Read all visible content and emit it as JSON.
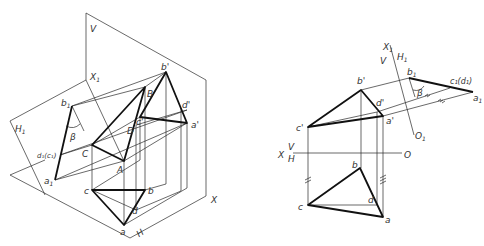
{
  "figure": {
    "left_view": {
      "title": "Isometric view of auxiliary plane projection",
      "labels": {
        "V": "V",
        "H": "H",
        "H1": "H",
        "H1_sub": "1",
        "X": "X",
        "X1": "X",
        "X1_sub": "1",
        "b_prime": "b'",
        "d_prime": "d'",
        "a_prime": "a'",
        "c_prime": "c'",
        "B": "B",
        "D": "D",
        "A": "A",
        "C": "C",
        "a": "a",
        "b": "b",
        "c": "c",
        "d": "d",
        "b1": "b",
        "b1_sub": "1",
        "a1": "a",
        "a1_sub": "1",
        "d1c1": "d₁(c₁)",
        "beta": "β"
      }
    },
    "right_view": {
      "title": "Orthographic projection with auxiliary view",
      "labels": {
        "X": "X",
        "V": "V",
        "H": "H",
        "O": "O",
        "X1": "X",
        "X1_sub": "1",
        "V_aux": "V",
        "H1": "H",
        "H1_sub": "1",
        "O1": "O",
        "O1_sub": "1",
        "b_prime": "b'",
        "d_prime": "d'",
        "a_prime": "a'",
        "c_prime": "c'",
        "a": "a",
        "b": "b",
        "c": "c",
        "d": "d",
        "b1": "b",
        "b1_sub": "1",
        "c1d1": "c₁(d₁)",
        "a1": "a",
        "a1_sub": "1",
        "beta": "β"
      }
    }
  }
}
